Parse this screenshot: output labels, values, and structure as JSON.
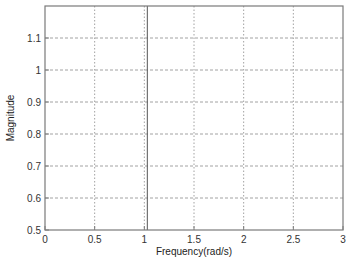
{
  "chart_data": {
    "type": "line",
    "title": "",
    "xlabel": "Frequency(rad/s)",
    "ylabel": "Magnitude",
    "xlim": [
      0,
      3
    ],
    "ylim": [
      0.5,
      1.2
    ],
    "xticks": [
      0,
      0.5,
      1,
      1.5,
      2,
      2.5,
      3
    ],
    "xtick_labels": [
      "0",
      "0.5",
      "1",
      "1.5",
      "2",
      "2.5",
      "3"
    ],
    "yticks": [
      0.5,
      0.6,
      0.7,
      0.8,
      0.9,
      1.0,
      1.1
    ],
    "ytick_labels": [
      "0.5",
      "0.6",
      "0.7",
      "0.8",
      "0.9",
      "1",
      "1.1"
    ],
    "grid": true,
    "legend": null,
    "series": [
      {
        "name": "magnitude response",
        "color": "#555555",
        "x": [
          1.03,
          1.03
        ],
        "y": [
          0.5,
          1.2
        ],
        "note": "vertical solid line spanning full y-range near x = 1.03"
      }
    ]
  },
  "colors": {
    "frame": "#7a7a7a",
    "grid": "#8a8a8a",
    "line": "#555555",
    "background": "#ffffff"
  }
}
